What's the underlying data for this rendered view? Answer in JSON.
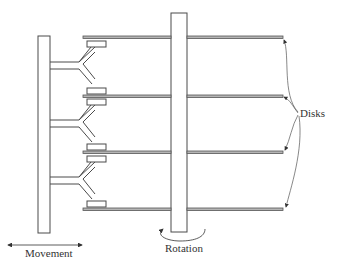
{
  "diagram": {
    "labels": {
      "disks": "Disks",
      "movement": "Movement",
      "rotation": "Rotation"
    },
    "colors": {
      "stroke": "#4a4a4a",
      "platter_fill": "#9a9a9a",
      "background": "#ffffff"
    },
    "components": {
      "actuator": "actuator-column",
      "spindle": "spindle",
      "platters": [
        {
          "id": "platter-1",
          "y": 37
        },
        {
          "id": "platter-2",
          "y": 96
        },
        {
          "id": "platter-3",
          "y": 152
        },
        {
          "id": "platter-4",
          "y": 209
        }
      ],
      "arm_count": 3,
      "head_count": 6
    }
  }
}
